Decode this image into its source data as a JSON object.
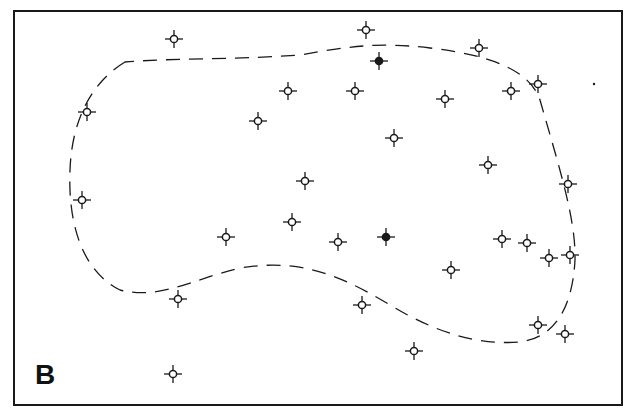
{
  "panel_label": "B",
  "colors": {
    "ink": "#1a1a1a",
    "background": "#ffffff"
  },
  "boundary": {
    "style": "dashed",
    "path": "M 125 62 C 95 80, 72 115, 70 170 C 68 220, 80 270, 120 290 C 160 300, 190 280, 240 268 C 300 258, 340 275, 390 305 C 440 335, 480 345, 520 342 C 550 338, 572 315, 575 260 C 576 220, 560 170, 540 100 C 530 70, 490 55, 430 48 C 380 42, 350 46, 300 55 C 230 60, 170 58, 125 62 Z"
  },
  "markers": [
    {
      "x": 174,
      "y": 39,
      "filled": false
    },
    {
      "x": 366,
      "y": 30,
      "filled": false
    },
    {
      "x": 479,
      "y": 48,
      "filled": false
    },
    {
      "x": 379,
      "y": 61,
      "filled": true
    },
    {
      "x": 288,
      "y": 91,
      "filled": false
    },
    {
      "x": 355,
      "y": 91,
      "filled": false
    },
    {
      "x": 445,
      "y": 99,
      "filled": false
    },
    {
      "x": 511,
      "y": 91,
      "filled": false
    },
    {
      "x": 538,
      "y": 84,
      "filled": false
    },
    {
      "x": 87,
      "y": 112,
      "filled": false
    },
    {
      "x": 258,
      "y": 121,
      "filled": false
    },
    {
      "x": 394,
      "y": 138,
      "filled": false
    },
    {
      "x": 488,
      "y": 165,
      "filled": false
    },
    {
      "x": 305,
      "y": 181,
      "filled": false
    },
    {
      "x": 568,
      "y": 184,
      "filled": false
    },
    {
      "x": 82,
      "y": 200,
      "filled": false
    },
    {
      "x": 292,
      "y": 222,
      "filled": false
    },
    {
      "x": 226,
      "y": 237,
      "filled": false
    },
    {
      "x": 338,
      "y": 242,
      "filled": false
    },
    {
      "x": 386,
      "y": 237,
      "filled": true
    },
    {
      "x": 502,
      "y": 239,
      "filled": false
    },
    {
      "x": 527,
      "y": 243,
      "filled": false
    },
    {
      "x": 549,
      "y": 258,
      "filled": false
    },
    {
      "x": 570,
      "y": 255,
      "filled": false
    },
    {
      "x": 451,
      "y": 270,
      "filled": false
    },
    {
      "x": 178,
      "y": 299,
      "filled": false
    },
    {
      "x": 362,
      "y": 305,
      "filled": false
    },
    {
      "x": 538,
      "y": 325,
      "filled": false
    },
    {
      "x": 565,
      "y": 334,
      "filled": false
    },
    {
      "x": 414,
      "y": 351,
      "filled": false
    },
    {
      "x": 173,
      "y": 374,
      "filled": false
    }
  ],
  "stray_dot": {
    "x": 594,
    "y": 84
  }
}
